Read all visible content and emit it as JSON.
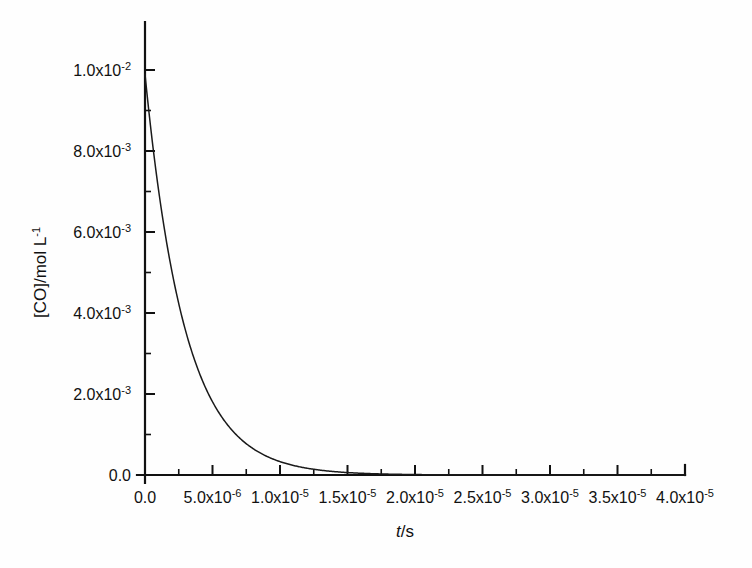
{
  "chart_data": {
    "type": "line",
    "title": "",
    "subtitle": "",
    "xlabel": "t/s",
    "ylabel": "[CO]/mol L-1",
    "xlabel_parts": {
      "italic": "t",
      "rest": "/s"
    },
    "ylabel_parts": {
      "base": "[CO]/mol L",
      "exponent": "-1"
    },
    "xlim": [
      0,
      4e-05
    ],
    "ylim": [
      0,
      0.0108
    ],
    "grid": false,
    "legend": null,
    "legend_position": "none",
    "frame": "left-bottom",
    "x_ticks": [
      0,
      5e-06,
      1e-05,
      1.5e-05,
      2e-05,
      2.5e-05,
      3e-05,
      3.5e-05,
      4e-05
    ],
    "x_tick_labels": [
      {
        "mantissa": "0.0",
        "exponent": ""
      },
      {
        "mantissa": "5.0x10",
        "exponent": "-6"
      },
      {
        "mantissa": "1.0x10",
        "exponent": "-5"
      },
      {
        "mantissa": "1.5x10",
        "exponent": "-5"
      },
      {
        "mantissa": "2.0x10",
        "exponent": "-5"
      },
      {
        "mantissa": "2.5x10",
        "exponent": "-5"
      },
      {
        "mantissa": "3.0x10",
        "exponent": "-5"
      },
      {
        "mantissa": "3.5x10",
        "exponent": "-5"
      },
      {
        "mantissa": "4.0x10",
        "exponent": "-5"
      }
    ],
    "x_minor_ticks_between": 1,
    "y_ticks": [
      0,
      0.002,
      0.004,
      0.006,
      0.008,
      0.01
    ],
    "y_tick_labels": [
      {
        "mantissa": "0.0",
        "exponent": ""
      },
      {
        "mantissa": "2.0x10",
        "exponent": "-3"
      },
      {
        "mantissa": "4.0x10",
        "exponent": "-3"
      },
      {
        "mantissa": "6.0x10",
        "exponent": "-3"
      },
      {
        "mantissa": "8.0x10",
        "exponent": "-3"
      },
      {
        "mantissa": "1.0x10",
        "exponent": "-2"
      }
    ],
    "y_minor_ticks_between": 1,
    "series": [
      {
        "name": "[CO]",
        "model": "exponential-decay",
        "initial_value": 0.0099,
        "rate_constant": 340000,
        "x": [
          0.0,
          5e-07,
          1e-06,
          1.5e-06,
          2e-06,
          2.5e-06,
          3e-06,
          3.5e-06,
          4e-06,
          4.5e-06,
          5e-06,
          5.5e-06,
          6e-06,
          6.5e-06,
          7e-06,
          7.5e-06,
          8e-06,
          8.5e-06,
          9e-06,
          9.5e-06,
          1e-05,
          1.1e-05,
          1.2e-05,
          1.3e-05,
          1.4e-05,
          1.5e-05,
          1.6e-05,
          1.7e-05,
          1.8e-05,
          1.9e-05,
          2e-05,
          2.2e-05,
          2.4e-05,
          2.6e-05,
          2.8e-05,
          3e-05,
          3.2e-05,
          3.4e-05,
          3.6e-05,
          3.8e-05,
          4e-05
        ],
        "y": [
          0.0099,
          0.00835,
          0.00705,
          0.00595,
          0.00502,
          0.00423,
          0.00357,
          0.00302,
          0.00254,
          0.00215,
          0.00181,
          0.00153,
          0.00129,
          0.00109,
          0.00092,
          0.00077,
          0.00065,
          0.00055,
          0.00046,
          0.00039,
          0.00033,
          0.00024,
          0.00017,
          0.00012,
          8.4e-05,
          6e-05,
          4.3e-05,
          3e-05,
          2.1e-05,
          1.5e-05,
          1.1e-05,
          5.6e-06,
          2.8e-06,
          1.4e-06,
          7e-07,
          3.7e-07,
          1.9e-07,
          9e-08,
          5e-08,
          2e-08,
          1e-08
        ]
      }
    ]
  },
  "colors": {
    "background": "#fefefe",
    "axis": "#111111",
    "curve": "#1a1a1a",
    "text": "#111111"
  }
}
